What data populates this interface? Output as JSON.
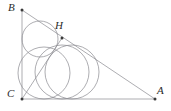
{
  "figure": {
    "kind": "geometry-diagram",
    "canvas": {
      "width": 171,
      "height": 111
    },
    "stroke_color": "#8a8a8f",
    "label_color": "#2b2b2b",
    "point_color": "#3a3a3a",
    "background": "#ffffff",
    "stroke_width": 0.7
  },
  "points": [
    {
      "id": "B",
      "label": "B",
      "x": 22,
      "y": 10,
      "label_x": 8,
      "label_y": 2,
      "dot": true
    },
    {
      "id": "H",
      "label": "H",
      "x": 62,
      "y": 38,
      "label_x": 55,
      "label_y": 20,
      "dot": true
    },
    {
      "id": "A",
      "label": "A",
      "x": 155,
      "y": 99,
      "label_x": 157,
      "label_y": 85,
      "dot": true
    },
    {
      "id": "C",
      "label": "C",
      "x": 22,
      "y": 99,
      "label_x": 7,
      "label_y": 88,
      "dot": true
    }
  ],
  "segments": [
    {
      "id": "BC",
      "from": "B",
      "to": "C",
      "x1": 22,
      "y1": 10,
      "x2": 22,
      "y2": 99
    },
    {
      "id": "CA",
      "from": "C",
      "to": "A",
      "x1": 22,
      "y1": 99,
      "x2": 155,
      "y2": 99
    },
    {
      "id": "BA",
      "from": "B",
      "to": "A",
      "x1": 22,
      "y1": 10,
      "x2": 155,
      "y2": 99
    },
    {
      "id": "CH",
      "from": "C",
      "to": "H",
      "x1": 22,
      "y1": 99,
      "x2": 62,
      "y2": 38
    }
  ],
  "circles": [
    {
      "id": "incircle-BCH",
      "cx": 40,
      "cy": 39,
      "r": 18
    },
    {
      "id": "incircle-ACH",
      "cx": 62,
      "cy": 72,
      "r": 27
    },
    {
      "id": "incircle-ABC",
      "cx": 44,
      "cy": 73,
      "r": 26
    },
    {
      "id": "circle-right",
      "cx": 72,
      "cy": 72,
      "r": 27
    }
  ]
}
